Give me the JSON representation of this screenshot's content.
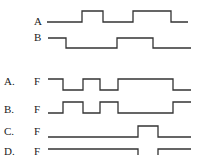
{
  "inputs": {
    "A": {
      "label": "A",
      "segments": "low-high-low-high-low"
    },
    "B": {
      "label": "B",
      "segments": "high-low-high-low"
    }
  },
  "options": [
    {
      "letter": "A.",
      "signal": "F"
    },
    {
      "letter": "B.",
      "signal": "F"
    },
    {
      "letter": "C.",
      "signal": "F"
    },
    {
      "letter": "D.",
      "signal": "F"
    }
  ],
  "waveforms": {
    "A": "M47,22 L82,22 L82,11 L103,11 L103,22 L133,22 L133,11 L171,11 L171,22 L188,22",
    "B": "M48,38 L66,38 L66,48 L117,48 L117,38 L153,38 L153,48 L191,48",
    "optA": "M48,79 L63,79 L63,90 L83,90 L83,79 L100,79 L100,90 L118,90 L118,79 L173,79 L173,90 L191,90",
    "optB": "M48,113 L63,113 L63,102 L83,102 L83,113 L100,113 L100,102 L118,102 L118,113 L173,113 L173,102 L191,102",
    "optC": "M48,137 L138,137 L138,126 L158,126 L158,137 L191,137",
    "optD": "M48,149 L138,149 L138,158 M158,158 L158,149 L191,149"
  }
}
